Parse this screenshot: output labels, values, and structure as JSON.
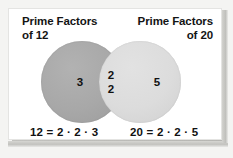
{
  "figure": {
    "type": "venn-diagram",
    "title_left": "Prime Factors of 12",
    "title_right": "Prime Factors of 20"
  },
  "headings": {
    "left": {
      "line1": "Prime Factors",
      "line2": "of 12"
    },
    "right": {
      "line1": "Prime Factors",
      "line2": "of 20"
    }
  },
  "regions": {
    "left_only": "3",
    "intersection_top": "2",
    "intersection_bottom": "2",
    "right_only": "5"
  },
  "equations": {
    "left": "12 = 2 · 2 · 3",
    "right": "20 = 2 · 2 · 5"
  },
  "colors": {
    "left_circle": "#a8a8a8",
    "right_circle": "#dcdcdc",
    "intersection": "#d4d4d4",
    "panel": "#ffffff",
    "background": "#f4f4f2",
    "text": "#111111"
  },
  "chart_data": {
    "type": "venn",
    "sets": [
      {
        "name": "Prime Factors of 12",
        "label": "Prime Factors of 12",
        "number": 12,
        "factors": [
          2,
          2,
          3
        ],
        "factorization": "12 = 2 · 2 · 3",
        "fill": "#a8a8a8"
      },
      {
        "name": "Prime Factors of 20",
        "label": "Prime Factors of 20",
        "number": 20,
        "factors": [
          2,
          2,
          5
        ],
        "factorization": "20 = 2 · 2 · 5",
        "fill": "#dcdcdc"
      }
    ],
    "regions": [
      {
        "region": "left_only",
        "members": [
          "3"
        ],
        "count": 1
      },
      {
        "region": "intersection",
        "members": [
          "2",
          "2"
        ],
        "count": 2
      },
      {
        "region": "right_only",
        "members": [
          "5"
        ],
        "count": 1
      }
    ],
    "gcf": 4,
    "legend": "none",
    "grid": false
  }
}
